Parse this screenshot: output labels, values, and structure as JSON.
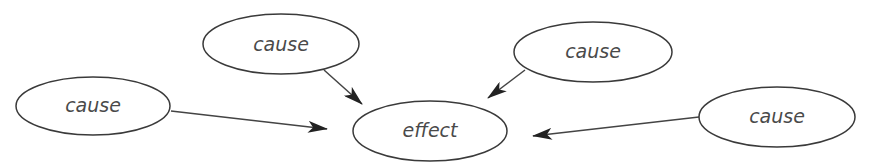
{
  "diagram": {
    "type": "cause-effect",
    "nodes": [
      {
        "id": "cause-top-left",
        "label": "cause",
        "cx": 281,
        "cy": 44,
        "rx": 78,
        "ry": 30
      },
      {
        "id": "cause-left",
        "label": "cause",
        "cx": 93,
        "cy": 106,
        "rx": 77,
        "ry": 29
      },
      {
        "id": "effect",
        "label": "effect",
        "cx": 430,
        "cy": 131,
        "rx": 77,
        "ry": 30
      },
      {
        "id": "cause-top-right",
        "label": "cause",
        "cx": 593,
        "cy": 52,
        "rx": 79,
        "ry": 30
      },
      {
        "id": "cause-right",
        "label": "cause",
        "cx": 777,
        "cy": 117,
        "rx": 78,
        "ry": 30
      }
    ],
    "edges": [
      {
        "from": "cause-top-left",
        "to": "effect"
      },
      {
        "from": "cause-left",
        "to": "effect"
      },
      {
        "from": "cause-top-right",
        "to": "effect"
      },
      {
        "from": "cause-right",
        "to": "effect"
      }
    ],
    "colors": {
      "stroke": "#3a3a3a",
      "text": "#4a4a4a",
      "arrow": "#222222",
      "background": "#ffffff"
    }
  }
}
